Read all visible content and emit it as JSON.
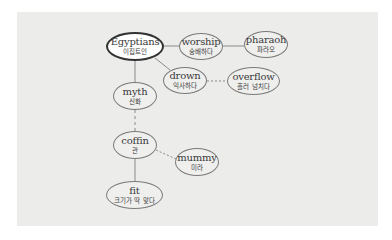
{
  "diagram": {
    "type": "word-map",
    "colors": {
      "panel_background": "#ececeb",
      "node_border": "#7a7a7a",
      "main_node_border": "#333333",
      "edge": "#8a8a8a",
      "text": "#3a3a3a"
    },
    "nodes": [
      {
        "id": "egyptians",
        "en": "Egyptians",
        "ko": "이집트인",
        "main": true
      },
      {
        "id": "worship",
        "en": "worship",
        "ko": "숭배하다"
      },
      {
        "id": "pharaoh",
        "en": "pharaoh",
        "ko": "파라오"
      },
      {
        "id": "drown",
        "en": "drown",
        "ko": "익사하다"
      },
      {
        "id": "overflow",
        "en": "overflow",
        "ko": "흘러 넘치다"
      },
      {
        "id": "myth",
        "en": "myth",
        "ko": "신화"
      },
      {
        "id": "coffin",
        "en": "coffin",
        "ko": "관"
      },
      {
        "id": "mummy",
        "en": "mummy",
        "ko": "미라"
      },
      {
        "id": "fit",
        "en": "fit",
        "ko": "크기가 딱 맞다"
      }
    ],
    "edges": [
      {
        "from": "egyptians",
        "to": "worship",
        "style": "solid"
      },
      {
        "from": "worship",
        "to": "pharaoh",
        "style": "solid"
      },
      {
        "from": "egyptians",
        "to": "drown",
        "style": "solid"
      },
      {
        "from": "drown",
        "to": "overflow",
        "style": "dashed"
      },
      {
        "from": "egyptians",
        "to": "myth",
        "style": "solid"
      },
      {
        "from": "myth",
        "to": "coffin",
        "style": "dashed"
      },
      {
        "from": "coffin",
        "to": "mummy",
        "style": "dashed"
      },
      {
        "from": "coffin",
        "to": "fit",
        "style": "solid"
      }
    ]
  }
}
